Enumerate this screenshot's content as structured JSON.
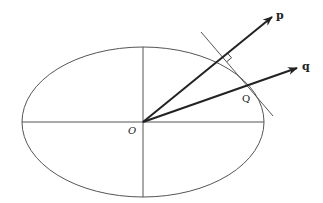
{
  "diagram": {
    "type": "ellipse-tangent-vectors",
    "labels": {
      "origin": "O",
      "point": "Q",
      "vector_p": "p",
      "vector_q": "q"
    },
    "colors": {
      "stroke": "#333333",
      "thin_stroke": "#555555",
      "background": "#ffffff"
    },
    "ellipse": {
      "cx": 143,
      "cy": 122,
      "rx": 121,
      "ry": 75
    },
    "annotations": [
      "right-angle marker between p and tangent line at Q"
    ]
  }
}
